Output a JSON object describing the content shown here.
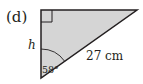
{
  "figure": {
    "part_label": "(d)",
    "side_label": "h",
    "hypotenuse_label": "27 cm",
    "angle_label": "58°",
    "fill_color": "#d5d5d5",
    "stroke_color": "#231f20"
  }
}
